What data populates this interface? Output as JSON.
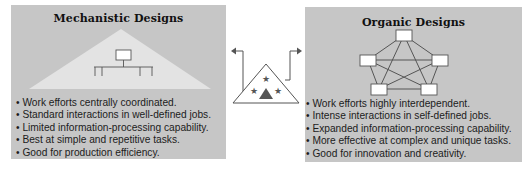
{
  "diagram": {
    "left_panel": {
      "title": "Mechanistic Designs",
      "icon": "hierarchy-pyramid",
      "bullets": [
        "• Work efforts centrally coordinated.",
        "• Standard interactions in well-defined jobs.",
        "• Limited information-processing capability.",
        "• Best at simple and repetitive tasks.",
        "• Good for production efficiency."
      ]
    },
    "center": {
      "icon": "organization-triangle-with-stars",
      "arrows": [
        "left-arrow",
        "right-arrow"
      ]
    },
    "right_panel": {
      "title": "Organic Designs",
      "icon": "network-pentagon",
      "bullets": [
        "• Work efforts highly interdependent.",
        "• Intense interactions in self-defined jobs.",
        "• Expanded information-processing capability.",
        "• More effective at complex and unique tasks.",
        "• Good for innovation and creativity."
      ]
    },
    "colors": {
      "panel_bg": "#c6c6c6",
      "triangle_fill": "#e4e4e4",
      "line": "#555555",
      "box_fill": "#ffffff"
    }
  }
}
